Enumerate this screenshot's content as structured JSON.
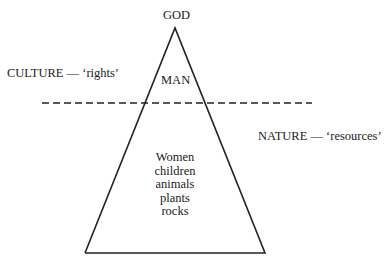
{
  "diagram": {
    "apex_label": "GOD",
    "top_section_label": "MAN",
    "culture_label": "CULTURE — ‘rights’",
    "nature_label": "NATURE — ‘resources’",
    "bottom_section_items": [
      "Women",
      "children",
      "animals",
      "plants",
      "rocks"
    ],
    "line_color": "#222222",
    "background": "#ffffff"
  }
}
